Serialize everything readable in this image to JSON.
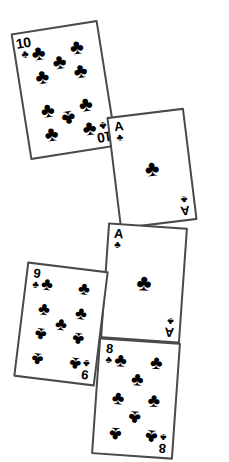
{
  "scene": {
    "title": "Scattered playing cards",
    "background_color": "#ffffff",
    "card_face_color": "#ffffff",
    "border_color": "#4a4a4a",
    "pip_color": "#000000",
    "suit_symbol": "♣",
    "suit_name": "clubs",
    "card_count": 5
  },
  "cards": [
    {
      "id": "card-ten-of-clubs",
      "rank": "10",
      "suit": "♣",
      "suit_name": "clubs",
      "name": "10 of clubs",
      "rotation_deg": -9,
      "left": 20,
      "top": 26,
      "pip_count": 10,
      "pips": [
        {
          "x": 27,
          "y": 17
        },
        {
          "x": 73,
          "y": 17
        },
        {
          "x": 27,
          "y": 36
        },
        {
          "x": 73,
          "y": 36
        },
        {
          "x": 50,
          "y": 27,
          "inverted": false
        },
        {
          "x": 50,
          "y": 73,
          "inverted": true
        },
        {
          "x": 27,
          "y": 64
        },
        {
          "x": 73,
          "y": 64
        },
        {
          "x": 27,
          "y": 83
        },
        {
          "x": 73,
          "y": 83
        }
      ]
    },
    {
      "id": "card-ace-of-clubs-upper",
      "rank": "A",
      "suit": "♣",
      "suit_name": "clubs",
      "name": "Ace of clubs",
      "rotation_deg": -7,
      "left": 113,
      "top": 112,
      "pip_count": 1,
      "pips": [
        {
          "x": 50,
          "y": 50
        }
      ]
    },
    {
      "id": "card-ace-of-clubs-lower",
      "rank": "A",
      "suit": "♣",
      "suit_name": "clubs",
      "name": "Ace of clubs",
      "rotation_deg": 4,
      "left": 104,
      "top": 225,
      "pip_count": 1,
      "pips": [
        {
          "x": 50,
          "y": 50
        }
      ]
    },
    {
      "id": "card-nine-of-clubs",
      "rank": "9",
      "suit": "♣",
      "suit_name": "clubs",
      "name": "9 of clubs",
      "rotation_deg": 7,
      "left": 20,
      "top": 266,
      "pip_count": 9,
      "pips": [
        {
          "x": 26,
          "y": 16
        },
        {
          "x": 74,
          "y": 16
        },
        {
          "x": 26,
          "y": 38
        },
        {
          "x": 74,
          "y": 38
        },
        {
          "x": 50,
          "y": 50
        },
        {
          "x": 26,
          "y": 62,
          "inverted": true
        },
        {
          "x": 74,
          "y": 62,
          "inverted": true
        },
        {
          "x": 26,
          "y": 84,
          "inverted": true
        },
        {
          "x": 74,
          "y": 84,
          "inverted": true
        }
      ]
    },
    {
      "id": "card-eight-of-clubs",
      "rank": "8",
      "suit": "♣",
      "suit_name": "clubs",
      "name": "8 of clubs",
      "rotation_deg": 4,
      "left": 95,
      "top": 340,
      "pip_count": 8,
      "pips": [
        {
          "x": 27,
          "y": 17
        },
        {
          "x": 73,
          "y": 17
        },
        {
          "x": 50,
          "y": 33
        },
        {
          "x": 27,
          "y": 50
        },
        {
          "x": 73,
          "y": 50
        },
        {
          "x": 50,
          "y": 67,
          "inverted": true
        },
        {
          "x": 27,
          "y": 83,
          "inverted": true
        },
        {
          "x": 73,
          "y": 83,
          "inverted": true
        }
      ]
    }
  ]
}
